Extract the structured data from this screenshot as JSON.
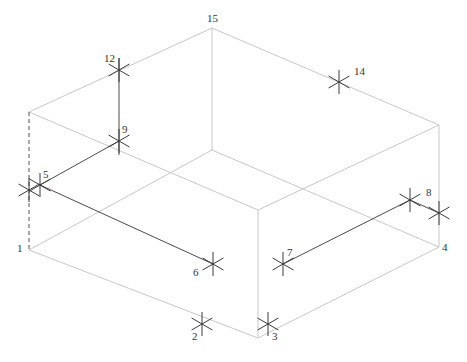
{
  "diagram": {
    "type": "isometric-box-wireframe",
    "colors": {
      "box_edges": "#c8c8c8",
      "lines": "#4a4a4a",
      "markers": "#3a3a3a",
      "labels": "#333333"
    },
    "box": {
      "top_back": [
        212,
        28
      ],
      "top_left": [
        29,
        112
      ],
      "top_right": [
        439,
        125
      ],
      "top_front": [
        258,
        210
      ],
      "bottom_back": [
        212,
        150
      ],
      "bottom_left": [
        29,
        250
      ],
      "bottom_right": [
        439,
        247
      ],
      "bottom_front": [
        258,
        338
      ]
    },
    "points": [
      {
        "id": "1",
        "label": "1",
        "x": 29,
        "y": 250,
        "marker": false,
        "label_dx": -12,
        "label_dy": 2
      },
      {
        "id": "2",
        "label": "2",
        "x": 202,
        "y": 324,
        "marker": true,
        "label_dx": -10,
        "label_dy": 16
      },
      {
        "id": "3",
        "label": "3",
        "x": 268,
        "y": 324,
        "marker": true,
        "label_dx": 4,
        "label_dy": 16
      },
      {
        "id": "4",
        "label": "4",
        "x": 439,
        "y": 247,
        "marker": false,
        "label_dx": 3,
        "label_dy": 4
      },
      {
        "id": "5",
        "label": "5",
        "x": 40,
        "y": 185,
        "marker": true,
        "label_dx": 3,
        "label_dy": -7
      },
      {
        "id": "5b",
        "label": "",
        "x": 29,
        "y": 190,
        "marker": true,
        "label_dx": 0,
        "label_dy": 0
      },
      {
        "id": "6",
        "label": "6",
        "x": 213,
        "y": 264,
        "marker": true,
        "label_dx": -20,
        "label_dy": 12
      },
      {
        "id": "7",
        "label": "7",
        "x": 283,
        "y": 264,
        "marker": true,
        "label_dx": 4,
        "label_dy": -8
      },
      {
        "id": "8",
        "label": "8",
        "x": 410,
        "y": 200,
        "marker": true,
        "label_dx": 16,
        "label_dy": -4
      },
      {
        "id": "8b",
        "label": "",
        "x": 439,
        "y": 213,
        "marker": true,
        "label_dx": 0,
        "label_dy": 0
      },
      {
        "id": "9",
        "label": "9",
        "x": 119,
        "y": 141,
        "marker": true,
        "label_dx": 3,
        "label_dy": -8
      },
      {
        "id": "12",
        "label": "12",
        "x": 119,
        "y": 70,
        "marker": true,
        "label_dx": -15,
        "label_dy": -8
      },
      {
        "id": "14",
        "label": "14",
        "x": 339,
        "y": 82,
        "marker": true,
        "label_dx": 15,
        "label_dy": -7
      },
      {
        "id": "15",
        "label": "15",
        "x": 212,
        "y": 28,
        "marker": false,
        "label_dx": -5,
        "label_dy": -6
      }
    ],
    "solid_lines": [
      {
        "from": [
          40,
          185
        ],
        "to": [
          213,
          264
        ]
      },
      {
        "from": [
          40,
          185
        ],
        "to": [
          119,
          141
        ]
      },
      {
        "from": [
          119,
          58
        ],
        "to": [
          119,
          155
        ]
      },
      {
        "from": [
          283,
          264
        ],
        "to": [
          410,
          200
        ]
      },
      {
        "from": [
          410,
          200
        ],
        "to": [
          439,
          213
        ]
      }
    ],
    "dashed_lines": [
      {
        "from": [
          29,
          112
        ],
        "to": [
          29,
          250
        ]
      }
    ]
  }
}
